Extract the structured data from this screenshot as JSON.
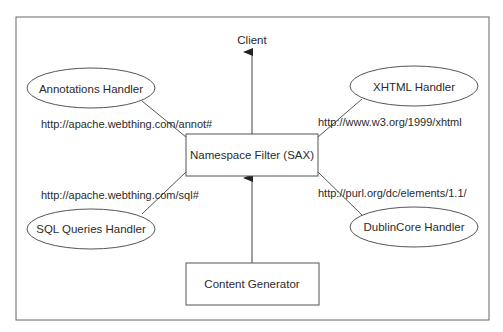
{
  "diagram": {
    "client": {
      "label": "Client"
    },
    "filter": {
      "label": "Namespace Filter (SAX)"
    },
    "generator": {
      "label": "Content Generator"
    },
    "handlers": [
      {
        "label": "Annotations Handler",
        "namespace": "http://apache.webthing.com/annot#"
      },
      {
        "label": "XHTML Handler",
        "namespace": "http://www.w3.org/1999/xhtml"
      },
      {
        "label": "SQL Queries Handler",
        "namespace": "http://apache.webthing.com/sql#"
      },
      {
        "label": "DublinCore Handler",
        "namespace": "http://purl.org/dc/elements/1.1/"
      }
    ],
    "colors": {
      "stroke": "#555555",
      "text": "#2b2b2b",
      "background": "#ffffff"
    }
  }
}
